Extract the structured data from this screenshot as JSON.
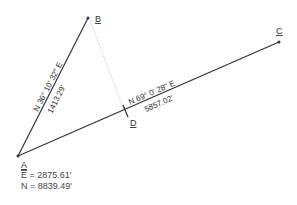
{
  "points": {
    "A": {
      "label": "A"
    },
    "B": {
      "label": "B"
    },
    "C": {
      "label": "C"
    },
    "D": {
      "label": "D"
    }
  },
  "segments": {
    "AB": {
      "bearing": "N 36° 10' 32\" E",
      "distance": "1413.29'"
    },
    "AC": {
      "bearing": "N 69° 0' 28\" E",
      "distance": "5857.02'"
    },
    "BD": {
      "style": "dotted"
    }
  },
  "coordinates_A": {
    "easting": "E = 2875.61'",
    "northing": "N = 8839.49'"
  },
  "colors": {
    "line": "#333333",
    "dotted": "#bbbbbb",
    "text": "#333333"
  }
}
